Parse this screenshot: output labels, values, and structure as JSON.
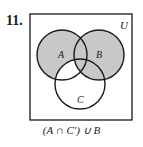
{
  "problem_number": "11.",
  "diagram": {
    "universe_label": "U",
    "sets": [
      {
        "label": "A"
      },
      {
        "label": "B"
      },
      {
        "label": "C"
      }
    ],
    "shaded_regions": [
      "A ∩ C'",
      "B"
    ],
    "shade_color": "#c8c8c8",
    "stroke_color": "#1a1a1a"
  },
  "caption": "(A ∩ C′) ∪ B"
}
